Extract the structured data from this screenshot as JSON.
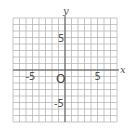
{
  "chart_data": {
    "type": "coordinate-grid",
    "title": "",
    "xlabel": "x",
    "ylabel": "y",
    "xlim": [
      -8,
      8
    ],
    "ylim": [
      -8,
      8
    ],
    "grid": true,
    "grid_step": 1,
    "origin_label": "O",
    "x_tick_labels": [
      {
        "value": -5,
        "label": "-5"
      },
      {
        "value": 5,
        "label": "5"
      }
    ],
    "y_tick_labels": [
      {
        "value": 5,
        "label": "5"
      },
      {
        "value": -5,
        "label": "-5"
      }
    ]
  }
}
